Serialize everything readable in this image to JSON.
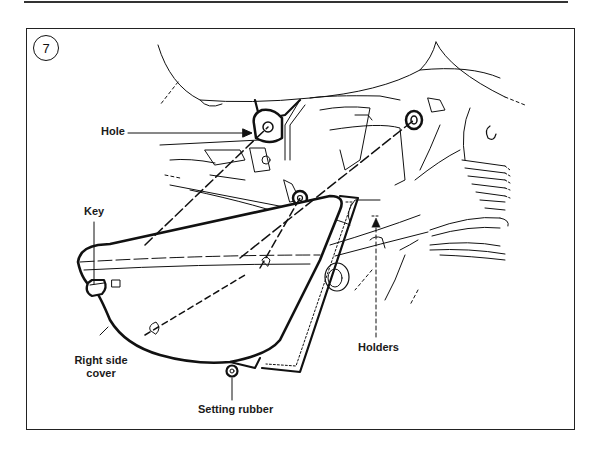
{
  "figure": {
    "number": "7",
    "labels": {
      "hole": "Hole",
      "key": "Key",
      "right_side_cover_line1": "Right side",
      "right_side_cover_line2": "cover",
      "setting_rubber": "Setting rubber",
      "holders": "Holders"
    },
    "colors": {
      "line": "#111111",
      "background": "#ffffff",
      "frame": "#222222"
    }
  }
}
